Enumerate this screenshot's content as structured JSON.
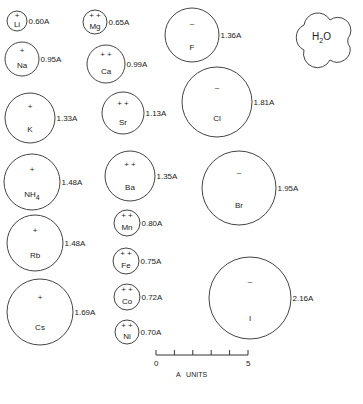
{
  "diagram": {
    "ions": [
      {
        "symbol": "Li",
        "charge": "+",
        "radius_label": "0.60A",
        "cx": 17,
        "cy": 21,
        "r": 10
      },
      {
        "symbol": "Mg",
        "charge": "+ +",
        "radius_label": "0.65A",
        "cx": 95,
        "cy": 22,
        "r": 12
      },
      {
        "symbol": "Na",
        "charge": "+",
        "radius_label": "0.95A",
        "cx": 22,
        "cy": 59,
        "r": 17
      },
      {
        "symbol": "Ca",
        "charge": "+ +",
        "radius_label": "0.99A",
        "cx": 106,
        "cy": 64,
        "r": 19
      },
      {
        "symbol": "K",
        "charge": "+",
        "radius_label": "1.33A",
        "cx": 30,
        "cy": 118,
        "r": 25
      },
      {
        "symbol": "Sr",
        "charge": "+ +",
        "radius_label": "1.13A",
        "cx": 123,
        "cy": 113,
        "r": 21
      },
      {
        "symbol": "NH4",
        "charge": "+",
        "radius_label": "1.48A",
        "cx": 32,
        "cy": 182,
        "r": 28
      },
      {
        "symbol": "Ba",
        "charge": "+ +",
        "radius_label": "1.35A",
        "cx": 130,
        "cy": 176,
        "r": 25
      },
      {
        "symbol": "Rb",
        "charge": "+",
        "radius_label": "1.48A",
        "cx": 35,
        "cy": 243,
        "r": 28
      },
      {
        "symbol": "Mn",
        "charge": "+ +",
        "radius_label": "0.80A",
        "cx": 127,
        "cy": 223,
        "r": 13
      },
      {
        "symbol": "Fe",
        "charge": "+ +",
        "radius_label": "0.75A",
        "cx": 126,
        "cy": 261,
        "r": 13
      },
      {
        "symbol": "Cs",
        "charge": "+",
        "radius_label": "1.69A",
        "cx": 40,
        "cy": 312,
        "r": 33
      },
      {
        "symbol": "Co",
        "charge": "+ +",
        "radius_label": "0.72A",
        "cx": 127,
        "cy": 297,
        "r": 13
      },
      {
        "symbol": "Ni",
        "charge": "+ +",
        "radius_label": "0.70A",
        "cx": 127,
        "cy": 332,
        "r": 12
      },
      {
        "symbol": "F",
        "charge": "–",
        "radius_label": "1.36A",
        "cx": 192,
        "cy": 35,
        "r": 27
      },
      {
        "symbol": "Cl",
        "charge": "–",
        "radius_label": "1.81A",
        "cx": 217,
        "cy": 102,
        "r": 35
      },
      {
        "symbol": "Br",
        "charge": "–",
        "radius_label": "1.95A",
        "cx": 239,
        "cy": 188,
        "r": 37
      },
      {
        "symbol": "I",
        "charge": "–",
        "radius_label": "2.16A",
        "cx": 250,
        "cy": 298,
        "r": 41
      }
    ],
    "water": {
      "label": "H",
      "subscript": "2",
      "label_end": "O"
    },
    "scale_bar": {
      "start_label": "0",
      "end_label": "5",
      "units_label": "A   UNITS",
      "ticks": 6
    }
  }
}
